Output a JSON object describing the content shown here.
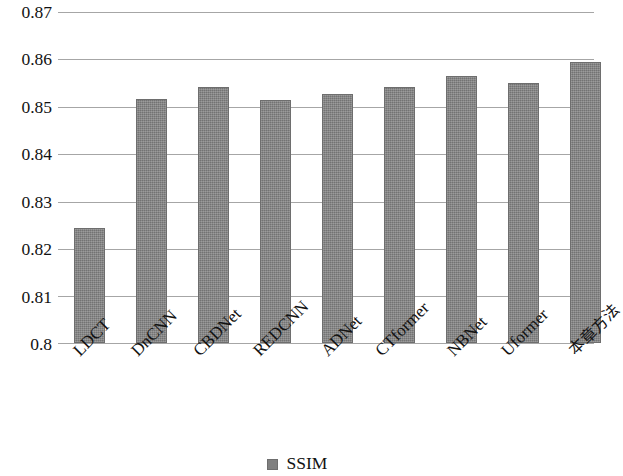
{
  "chart_data": {
    "type": "bar",
    "title": "",
    "subtitle": "",
    "xlabel": "",
    "ylabel": "",
    "ylim": [
      0.8,
      0.87
    ],
    "ytick_values": [
      0.87,
      0.86,
      0.85,
      0.84,
      0.83,
      0.82,
      0.81,
      0.8
    ],
    "ytick_labels": [
      "0.87",
      "0.86",
      "0.85",
      "0.84",
      "0.83",
      "0.82",
      "0.81",
      "0.8"
    ],
    "grid": true,
    "legend_position": "bottom-center",
    "bar_color": "#808080",
    "grid_color": "#a6a6a6",
    "categories": [
      "LDCT",
      "DnCNN",
      "CBDNet",
      "REDCNN",
      "ADNet",
      "CTformer",
      "NBNet",
      "Uformer",
      "本章方法"
    ],
    "series": [
      {
        "name": "SSIM",
        "values": [
          0.8243,
          0.8516,
          0.8542,
          0.8513,
          0.8527,
          0.8541,
          0.8564,
          0.8551,
          0.8595
        ]
      }
    ],
    "legend": [
      "SSIM"
    ]
  }
}
